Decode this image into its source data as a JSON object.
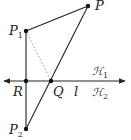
{
  "diagram": {
    "points": {
      "P": {
        "label": "P",
        "sub": "",
        "x": 88,
        "y": 6
      },
      "P1": {
        "label": "P",
        "sub": "1",
        "x": 26,
        "y": 31
      },
      "R": {
        "label": "R",
        "sub": "",
        "x": 26,
        "y": 81
      },
      "Q": {
        "label": "Q",
        "sub": "",
        "x": 51,
        "y": 81
      },
      "P2": {
        "label": "P",
        "sub": "2",
        "x": 26,
        "y": 129
      }
    },
    "line_label": "l",
    "half_planes": {
      "upper": {
        "label": "ℋ",
        "sub": "1"
      },
      "lower": {
        "label": "ℋ",
        "sub": "2"
      }
    },
    "colors": {
      "stroke": "#222222",
      "dotted": "#999999"
    }
  }
}
